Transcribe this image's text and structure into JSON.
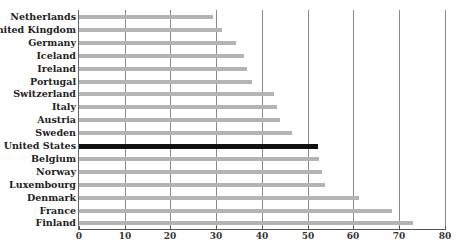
{
  "chart_data": {
    "type": "bar",
    "orientation": "horizontal",
    "title": "",
    "xlabel": "",
    "ylabel": "",
    "xlim": [
      0,
      80
    ],
    "x_ticks": [
      0,
      10,
      20,
      30,
      40,
      50,
      60,
      70,
      80
    ],
    "grid": true,
    "legend": null,
    "highlight": "United States",
    "colors": {
      "bar": "#b4b4b4",
      "highlight": "#111111",
      "grid": "#8a8a8a"
    },
    "categories": [
      "Netherlands",
      "United Kingdom",
      "Germany",
      "Iceland",
      "Ireland",
      "Portugal",
      "Switzerland",
      "Italy",
      "Austria",
      "Sweden",
      "United States",
      "Belgium",
      "Norway",
      "Luxembourg",
      "Denmark",
      "France",
      "Finland"
    ],
    "values": [
      29.3,
      31.3,
      34.4,
      36.1,
      36.7,
      37.9,
      42.7,
      43.3,
      43.9,
      46.6,
      52.3,
      52.5,
      53.2,
      53.9,
      61.2,
      68.5,
      73.1
    ]
  }
}
